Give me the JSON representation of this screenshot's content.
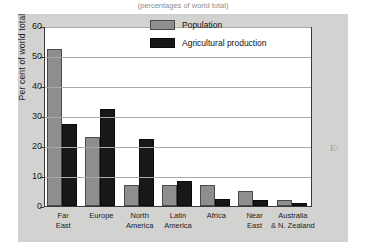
{
  "figure": {
    "title_partial": "(percentages of world total)",
    "margin_mark": "E/"
  },
  "legend": {
    "position": "top-center",
    "entries": [
      {
        "label": "Population",
        "color": "#8e8e8e",
        "swatch": "population-swatch"
      },
      {
        "label": "Agricultural production",
        "color": "#181818",
        "swatch": "agricultural-production-swatch"
      }
    ]
  },
  "axes": {
    "y_title": "Per cent of world total",
    "y_ticks": [
      "0",
      "10",
      "20",
      "30",
      "40",
      "50",
      "60"
    ]
  },
  "chart_data": {
    "type": "bar",
    "title": "(percentages of world total)",
    "xlabel": "",
    "ylabel": "Per cent of world total",
    "ylim": [
      0,
      60
    ],
    "yticks": [
      0,
      10,
      20,
      30,
      40,
      50,
      60
    ],
    "grid": true,
    "legend_position": "top-center",
    "categories": [
      "Far East",
      "Europe",
      "North America",
      "Latin America",
      "Africa",
      "Near East",
      "Australia & N. Zealand"
    ],
    "category_lines": [
      [
        "Far",
        "East"
      ],
      [
        "Europe",
        ""
      ],
      [
        "North",
        "America"
      ],
      [
        "Latin",
        "America"
      ],
      [
        "Africa",
        ""
      ],
      [
        "Near",
        "East"
      ],
      [
        "Australia",
        "& N. Zealand"
      ]
    ],
    "series": [
      {
        "name": "Population",
        "color": "#8e8e8e",
        "values": [
          52.5,
          23,
          7,
          7,
          7,
          5,
          2
        ]
      },
      {
        "name": "Agricultural production",
        "color": "#181818",
        "values": [
          27.5,
          32.5,
          22.5,
          8.5,
          2.5,
          2,
          1
        ]
      }
    ]
  }
}
